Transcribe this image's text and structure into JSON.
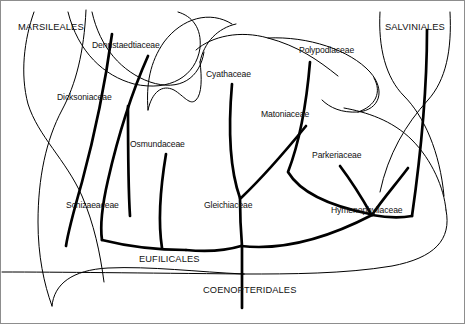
{
  "figure": {
    "type": "phylogenetic-tree-diagram",
    "background_color": "#ffffff",
    "line_color": "#000000",
    "border_color": "#8d8d8d",
    "text_color": "#111111"
  },
  "labels": {
    "orders": [
      {
        "id": "marsileales",
        "text": "MARSILEALES",
        "x": 18,
        "y": 23,
        "style": "uppercase"
      },
      {
        "id": "salviniales",
        "text": "SALVINIALES",
        "x": 385,
        "y": 23,
        "style": "uppercase"
      },
      {
        "id": "eufilicales",
        "text": "EUFILICALES",
        "x": 139,
        "y": 255,
        "style": "uppercase"
      },
      {
        "id": "coenopteridales",
        "text": "COENOPTERIDALES",
        "x": 203,
        "y": 286,
        "style": "uppercase"
      }
    ],
    "families": [
      {
        "id": "dennstaedtiaceae",
        "text": "Dennstaedtiaceae",
        "x": 92,
        "y": 41
      },
      {
        "id": "dicksoniaceae",
        "text": "Dicksoniaceae",
        "x": 57,
        "y": 93
      },
      {
        "id": "cyathaceae",
        "text": "Cyathaceae",
        "x": 206,
        "y": 70
      },
      {
        "id": "polypodiaceae",
        "text": "Polypodiaceae",
        "x": 299,
        "y": 46
      },
      {
        "id": "matoniaceae",
        "text": "Matoniaceae",
        "x": 261,
        "y": 110
      },
      {
        "id": "osmundaceae",
        "text": "Osmundaceae",
        "x": 130,
        "y": 140
      },
      {
        "id": "parkeriaceae",
        "text": "Parkeriaceae",
        "x": 312,
        "y": 151
      },
      {
        "id": "schizaeaceae",
        "text": "Schizaeaceae",
        "x": 66,
        "y": 201
      },
      {
        "id": "gleichiaceae",
        "text": "Gleichiaceae",
        "x": 204,
        "y": 201
      },
      {
        "id": "hymenophyllaceae",
        "text": "Hymenophyllaceae",
        "x": 331,
        "y": 206
      }
    ]
  },
  "branches": {
    "thick_stroke_width": 2.6,
    "thin_stroke_width": 1.0,
    "paths": [
      {
        "id": "trunk-coenopteridales",
        "weight": "thick",
        "d": "M 242 245 L 242 308"
      },
      {
        "id": "eufilicales-spine",
        "weight": "thick",
        "d": "M 96 222 C 150 262 190 250 236 245 C 285 250 330 238 372 214"
      },
      {
        "id": "schizaeaceae-branch",
        "weight": "thick",
        "d": "M 108 36 C 112 96 128 160 160 212 C 175 228 190 236 212 242"
      },
      {
        "id": "dicksoniaceae-branch",
        "weight": "thick",
        "d": "M 116 44 C 108 90 100 150 96 222"
      },
      {
        "id": "dennstaedtiaceae-branch",
        "weight": "thick",
        "d": "M 120 56 C 108 90 100 150 98 222"
      },
      {
        "id": "osmundaceae-branch",
        "weight": "thick",
        "d": "M 166 154 C 160 190 156 220 160 244"
      },
      {
        "id": "cyathaceae-branch",
        "weight": "thick",
        "d": "M 232 84 C 228 140 230 180 240 200"
      },
      {
        "id": "gleichiaceae-matoniaceae-join",
        "weight": "thick",
        "d": "M 306 125 C 286 150 262 182 240 200"
      },
      {
        "id": "gleichiaceae-stem",
        "weight": "thick",
        "d": "M 240 200 C 240 222 240 236 242 245"
      },
      {
        "id": "polypodiaceae-branch",
        "weight": "thick",
        "d": "M 310 61 C 306 110 296 150 285 178 C 300 196 330 208 372 214"
      },
      {
        "id": "parkeriaceae-branch",
        "weight": "thick",
        "d": "M 338 166 C 352 182 362 196 372 214"
      },
      {
        "id": "hymenophyllaceae-branch",
        "weight": "thick",
        "d": "M 408 166 C 396 184 382 200 372 214"
      },
      {
        "id": "marsileales-stem",
        "weight": "thick",
        "d": "M 112 36 C 104 78 96 130 84 182"
      },
      {
        "id": "salviniales-stem",
        "weight": "thick",
        "d": "M 427 30 C 426 90 420 160 412 214"
      },
      {
        "id": "marsileales-outer-left",
        "weight": "thin",
        "d": "M 34 28 C 22 72 24 110 44 146 C 62 184 76 230 86 272"
      },
      {
        "id": "marsileales-inner-left",
        "weight": "thin",
        "d": "M 88 26 C 84 70 72 110 58 160 C 48 200 44 250 42 300"
      },
      {
        "id": "dennstaedtiaceae-arch",
        "weight": "thin",
        "d": "M 124 28 C 120 68 132 92 152 110 C 176 126 190 120 196 104"
      },
      {
        "id": "dicksoniaceae-arch",
        "weight": "thin",
        "d": "M 120 28 C 126 64 142 86 166 102 C 186 116 198 114 204 100"
      },
      {
        "id": "cyathaceae-crown",
        "weight": "thin",
        "d": "M 146 106 C 150 78 176 60 206 58 C 238 56 258 74 262 104"
      },
      {
        "id": "cyathaceae-notch",
        "weight": "thin",
        "d": "M 152 110 C 156 92 172 86 184 98 C 192 106 196 106 200 98"
      },
      {
        "id": "polypodiaceae-crown",
        "weight": "thin",
        "d": "M 276 98 C 282 64 306 44 334 42 C 360 42 378 60 380 84 C 382 106 366 118 348 108"
      },
      {
        "id": "polypodiaceae-loop",
        "weight": "thin",
        "d": "M 380 84 C 382 104 364 116 344 108"
      },
      {
        "id": "salviniales-left",
        "weight": "thin",
        "d": "M 398 28 C 396 72 404 96 424 112 C 446 128 456 158 458 196"
      },
      {
        "id": "salviniales-right",
        "weight": "thin",
        "d": "M 456 26 C 454 66 446 92 428 110 C 404 130 384 160 372 200"
      },
      {
        "id": "right-outer-sweep",
        "weight": "thin",
        "d": "M 458 196 C 456 234 428 256 372 264 C 320 270 280 272 244 272"
      },
      {
        "id": "left-outer-sweep",
        "weight": "thin",
        "d": "M 42 300 C 44 268 80 254 140 268 C 190 274 222 272 244 272"
      },
      {
        "id": "base-rule",
        "weight": "thin",
        "d": "M 0 272 C 80 272 160 272 242 272"
      }
    ]
  }
}
